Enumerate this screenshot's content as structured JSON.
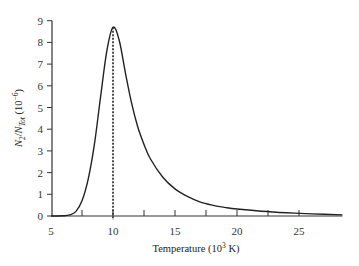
{
  "chart_data": {
    "type": "line",
    "title": "",
    "xlabel": "Temperature (10^3 K)",
    "xlabel_parts": {
      "main": "Temperature (10",
      "sup": "3",
      "tail": " K)"
    },
    "ylabel": "N_2/N_Tot (10^-6)",
    "ylabel_parts": {
      "n": "N",
      "sub1": "2",
      "slash": "/",
      "n2": "N",
      "sub2": "Tot",
      "pre": " (10",
      "sup": "−6",
      "post": ")"
    },
    "xlim": [
      5,
      28.5
    ],
    "ylim": [
      0,
      9
    ],
    "x_ticks": [
      5,
      7.5,
      10,
      12.5,
      15,
      17.5,
      20,
      22.5,
      25
    ],
    "x_tick_labels": [
      "5",
      "",
      "10",
      "",
      "15",
      "",
      "20",
      "",
      "25"
    ],
    "y_ticks": [
      0,
      1,
      2,
      3,
      4,
      5,
      6,
      7,
      8,
      9
    ],
    "y_tick_labels": [
      "0",
      "1",
      "2",
      "3",
      "4",
      "5",
      "6",
      "7",
      "8",
      "9"
    ],
    "grid": false,
    "legend": null,
    "annotations": [
      {
        "type": "vertical-dashed-line",
        "x": 10,
        "y_from": 0,
        "y_to": 8.7
      }
    ],
    "series": [
      {
        "name": "N2/NTot",
        "x": [
          5,
          6,
          6.5,
          7,
          7.5,
          8,
          8.5,
          9,
          9.5,
          10,
          10.5,
          11,
          11.5,
          12,
          12.5,
          13,
          14,
          15,
          16,
          17,
          18,
          19,
          20,
          22,
          24,
          26,
          28.5
        ],
        "values": [
          0,
          0.01,
          0.05,
          0.2,
          0.7,
          1.7,
          3.3,
          5.5,
          7.6,
          8.7,
          8.1,
          6.6,
          5.2,
          4.1,
          3.3,
          2.65,
          1.8,
          1.25,
          0.9,
          0.65,
          0.5,
          0.4,
          0.32,
          0.22,
          0.15,
          0.1,
          0.05
        ]
      }
    ]
  }
}
